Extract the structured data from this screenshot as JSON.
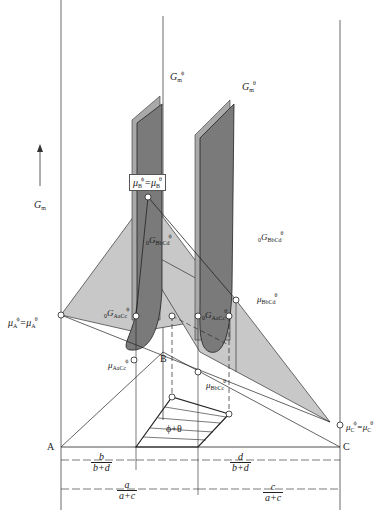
{
  "figure": {
    "axis_label": "G",
    "axis_label_sub": "m",
    "curves": {
      "phi": {
        "name": "G",
        "sub": "m",
        "sup": "ϕ"
      },
      "theta": {
        "name": "G",
        "sub": "m",
        "sup": "θ"
      }
    },
    "points": {
      "mu_B": {
        "text": "μ",
        "sup1": "ϕ",
        "sub1": "B",
        "eq": "=μ",
        "sup2": "θ",
        "sub2": "B"
      },
      "G_phi_BbCd": {
        "pre": "0",
        "name": "G",
        "sup": "ϕ",
        "sub": "BbCd"
      },
      "G_theta_BbCd": {
        "pre": "0",
        "name": "G",
        "sup": "θ",
        "sub": "BbCd"
      },
      "G_phi_AaCc": {
        "pre": "0",
        "name": "G",
        "sup": "ϕ",
        "sub": "AaCc"
      },
      "G_theta_AaCc": {
        "pre": "0",
        "name": "G",
        "sup": "θ",
        "sub": "AaCc"
      },
      "mu_theta_BbCd": {
        "name": "μ",
        "sup": "θ",
        "sub": "BbCd"
      },
      "mu_phi_AaCc": {
        "name": "μ",
        "sup": "ϕ",
        "sub": "AaCc"
      },
      "mu_theta_BbCc": {
        "name": "μ",
        "sup": "θ",
        "sub": "BbCc"
      },
      "mu_A": {
        "text": "μ",
        "sup1": "ϕ",
        "sub1": "A",
        "eq": "=μ",
        "sup2": "θ",
        "sub2": "A"
      },
      "mu_C": {
        "text": "μ",
        "sup1": "ϕ",
        "sub1": "C",
        "eq": "=μ",
        "sup2": "θ",
        "sub2": "C"
      }
    },
    "corners": {
      "A": "A",
      "B": "B",
      "C": "C"
    },
    "region_label": "ϕ+θ",
    "dimensions": {
      "b_frac": {
        "num": "b",
        "den": "b+d"
      },
      "d_frac": {
        "num": "d",
        "den": "b+d"
      },
      "a_frac": {
        "num": "a",
        "den": "a+c"
      },
      "c_frac": {
        "num": "c",
        "den": "a+c"
      }
    },
    "colors": {
      "plane": "#c8c8c8",
      "curve_fill": "#7a7a7a",
      "curve_edge": "#a9a9a9",
      "line": "#222222"
    }
  }
}
